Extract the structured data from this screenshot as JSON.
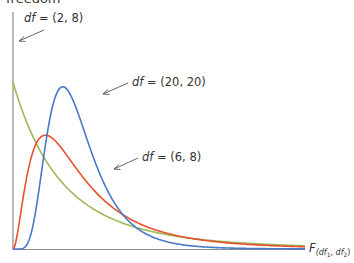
{
  "title_fragment": "freedom",
  "chart_data": {
    "type": "line",
    "xlabel": "F(df1, df2)",
    "ylabel": "",
    "grid": false,
    "legend": "inline annotations with arrows",
    "series": [
      {
        "name": "df = (2, 8)",
        "df1": 2,
        "df2": 8,
        "color": "#9bbb59",
        "shape": "monotonic decreasing from y-axis"
      },
      {
        "name": "df = (6, 8)",
        "df1": 6,
        "df2": 8,
        "color": "#e8502e",
        "shape": "right-skewed, peak near F≈0.5"
      },
      {
        "name": "df = (20, 20)",
        "df1": 20,
        "df2": 20,
        "color": "#4a78c8",
        "shape": "right-skewed, tall peak near F≈0.9"
      }
    ],
    "annotations": [
      {
        "text_prefix": "df",
        "text_rest": " = (2, 8)",
        "series": "df = (2, 8)"
      },
      {
        "text_prefix": "df",
        "text_rest": " = (20, 20)",
        "series": "df = (20, 20)"
      },
      {
        "text_prefix": "df",
        "text_rest": " = (6, 8)",
        "series": "df = (6, 8)"
      }
    ],
    "x_axis_label": {
      "main": "F",
      "sub1": "df",
      "sub1_idx": "1",
      "sep": ", ",
      "sub2": "df",
      "sub2_idx": "2"
    }
  },
  "colors": {
    "axis": "#7f7f7f",
    "green": "#9bbb59",
    "red": "#e8502e",
    "blue": "#4a78c8",
    "text": "#333333"
  }
}
